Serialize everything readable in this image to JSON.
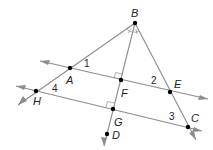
{
  "diagram": {
    "points": {
      "B": {
        "label": "B",
        "x": 135,
        "y": 23
      },
      "A": {
        "label": "A",
        "x": 70,
        "y": 68
      },
      "F": {
        "label": "F",
        "x": 121,
        "y": 80
      },
      "E": {
        "label": "E",
        "x": 170,
        "y": 92
      },
      "H": {
        "label": "H",
        "x": 36,
        "y": 91
      },
      "G": {
        "label": "G",
        "x": 113,
        "y": 109
      },
      "C": {
        "label": "C",
        "x": 188,
        "y": 127
      },
      "D": {
        "label": "D",
        "x": 107,
        "y": 134
      }
    },
    "angles": {
      "a1": "1",
      "a2": "2",
      "a3": "3",
      "a4": "4"
    },
    "lines": [
      "AE (through F)",
      "HC (through G)",
      "BH (through A)",
      "BC (through E)",
      "BD (through F, G)"
    ],
    "right_angles": [
      "F",
      "G"
    ],
    "congruent_angle_marks": "angles ABF and FBE at B"
  }
}
